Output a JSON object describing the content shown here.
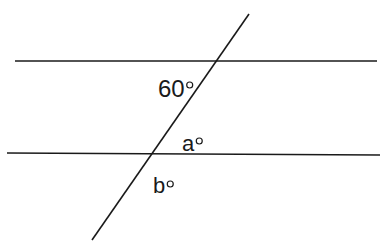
{
  "diagram": {
    "type": "parallel-lines-transversal",
    "colors": {
      "line": "#1a1a1a",
      "background": "#ffffff"
    },
    "lines": {
      "upper": {
        "x1": 15,
        "y1": 61,
        "x2": 377,
        "y2": 61
      },
      "lower": {
        "x1": 7,
        "y1": 153,
        "x2": 380,
        "y2": 155
      },
      "transversal": {
        "x1": 249,
        "y1": 14,
        "x2": 92,
        "y2": 240
      }
    },
    "labels": {
      "angle_60": {
        "value": "60",
        "x": 158,
        "y": 97
      },
      "angle_a": {
        "value": "a",
        "x": 182,
        "y": 151
      },
      "angle_b": {
        "value": "b",
        "x": 153,
        "y": 193
      }
    },
    "degree_symbol": "○"
  }
}
